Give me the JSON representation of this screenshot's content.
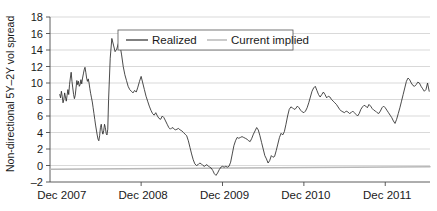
{
  "chart_data": {
    "type": "line",
    "title": "",
    "xlabel": "",
    "ylabel": "Non-directional 5Y–2Y vol spread",
    "ylim": [
      -2,
      18
    ],
    "y_ticks": [
      -2,
      0,
      2,
      4,
      6,
      8,
      10,
      12,
      14,
      16,
      18
    ],
    "y_tick_labels": [
      "–2",
      "0",
      "2",
      "4",
      "6",
      "8",
      "10",
      "12",
      "14",
      "16",
      "18"
    ],
    "x_tick_labels": [
      "Dec 2007",
      "Dec 2008",
      "Dec 2009",
      "Dec 2010",
      "Dec 2011"
    ],
    "x_tick_positions": [
      0,
      1,
      2,
      3,
      4
    ],
    "xlim": [
      -0.12,
      4.55
    ],
    "grid": true,
    "legend_position": "top-center",
    "legend": [
      {
        "name": "Realized",
        "color": "#2b2b2b"
      },
      {
        "name": "Current implied",
        "color": "#bdbdbd"
      }
    ],
    "series": [
      {
        "name": "Realized",
        "color": "#2b2b2b",
        "x": [
          0.0,
          0.01,
          0.02,
          0.03,
          0.04,
          0.05,
          0.06,
          0.07,
          0.08,
          0.09,
          0.1,
          0.11,
          0.12,
          0.13,
          0.14,
          0.15,
          0.16,
          0.17,
          0.18,
          0.19,
          0.2,
          0.21,
          0.22,
          0.23,
          0.24,
          0.25,
          0.26,
          0.27,
          0.28,
          0.29,
          0.3,
          0.31,
          0.32,
          0.33,
          0.34,
          0.35,
          0.36,
          0.37,
          0.38,
          0.39,
          0.4,
          0.41,
          0.42,
          0.43,
          0.44,
          0.45,
          0.46,
          0.47,
          0.48,
          0.49,
          0.5,
          0.51,
          0.52,
          0.53,
          0.54,
          0.55,
          0.56,
          0.57,
          0.58,
          0.59,
          0.6,
          0.62,
          0.64,
          0.66,
          0.68,
          0.7,
          0.72,
          0.74,
          0.76,
          0.78,
          0.8,
          0.82,
          0.84,
          0.86,
          0.88,
          0.9,
          0.92,
          0.94,
          0.96,
          0.98,
          1.0,
          1.02,
          1.04,
          1.06,
          1.08,
          1.1,
          1.12,
          1.14,
          1.16,
          1.18,
          1.2,
          1.22,
          1.24,
          1.26,
          1.28,
          1.3,
          1.32,
          1.34,
          1.36,
          1.38,
          1.4,
          1.42,
          1.44,
          1.46,
          1.48,
          1.5,
          1.52,
          1.54,
          1.56,
          1.58,
          1.6,
          1.62,
          1.64,
          1.66,
          1.68,
          1.7,
          1.72,
          1.74,
          1.76,
          1.78,
          1.8,
          1.82,
          1.84,
          1.86,
          1.88,
          1.9,
          1.92,
          1.94,
          1.96,
          1.98,
          2.0,
          2.02,
          2.04,
          2.06,
          2.08,
          2.1,
          2.12,
          2.14,
          2.16,
          2.18,
          2.2,
          2.22,
          2.24,
          2.26,
          2.28,
          2.3,
          2.32,
          2.34,
          2.36,
          2.38,
          2.4,
          2.42,
          2.44,
          2.46,
          2.48,
          2.5,
          2.52,
          2.54,
          2.56,
          2.58,
          2.6,
          2.62,
          2.64,
          2.66,
          2.68,
          2.7,
          2.72,
          2.74,
          2.76,
          2.78,
          2.8,
          2.82,
          2.84,
          2.86,
          2.88,
          2.9,
          2.92,
          2.94,
          2.96,
          2.98,
          3.0,
          3.02,
          3.04,
          3.06,
          3.08,
          3.1,
          3.12,
          3.14,
          3.16,
          3.18,
          3.2,
          3.22,
          3.24,
          3.26,
          3.28,
          3.3,
          3.32,
          3.34,
          3.36,
          3.38,
          3.4,
          3.42,
          3.44,
          3.46,
          3.48,
          3.5,
          3.52,
          3.54,
          3.56,
          3.58,
          3.6,
          3.62,
          3.64,
          3.66,
          3.68,
          3.7,
          3.72,
          3.74,
          3.76,
          3.78,
          3.8,
          3.82,
          3.84,
          3.86,
          3.88,
          3.9,
          3.92,
          3.94,
          3.96,
          3.98,
          4.0,
          4.02,
          4.04,
          4.06,
          4.08,
          4.1,
          4.12,
          4.14,
          4.16,
          4.18,
          4.2,
          4.22,
          4.24,
          4.26,
          4.28,
          4.3,
          4.32,
          4.34,
          4.36,
          4.38,
          4.4,
          4.42,
          4.44,
          4.46,
          4.48,
          4.5,
          4.52,
          4.54
        ],
        "y": [
          8.6,
          8.2,
          9.0,
          8.4,
          7.6,
          8.0,
          8.8,
          8.3,
          7.8,
          8.5,
          9.2,
          8.6,
          9.8,
          10.6,
          11.3,
          10.2,
          9.4,
          8.6,
          8.1,
          8.5,
          9.4,
          10.3,
          9.8,
          10.2,
          9.6,
          9.8,
          10.4,
          9.9,
          10.6,
          11.1,
          11.6,
          11.9,
          11.3,
          10.6,
          10.2,
          10.5,
          10.0,
          9.3,
          8.7,
          8.2,
          7.7,
          7.0,
          6.3,
          5.6,
          4.9,
          4.3,
          3.7,
          3.2,
          3.0,
          3.6,
          4.6,
          5.0,
          4.2,
          3.8,
          4.2,
          5.0,
          4.6,
          3.9,
          3.7,
          4.4,
          8.0,
          13.0,
          15.4,
          14.6,
          13.8,
          14.1,
          14.8,
          14.6,
          13.4,
          12.0,
          11.0,
          10.3,
          9.6,
          9.2,
          9.0,
          8.8,
          9.1,
          8.9,
          9.5,
          10.2,
          10.8,
          10.0,
          9.2,
          8.4,
          7.8,
          7.2,
          6.7,
          6.3,
          6.1,
          6.4,
          6.0,
          5.7,
          5.6,
          6.0,
          5.8,
          5.4,
          5.0,
          4.6,
          4.4,
          4.6,
          4.5,
          4.3,
          4.4,
          4.5,
          4.3,
          4.2,
          4.0,
          3.8,
          3.6,
          3.0,
          2.2,
          1.4,
          0.7,
          0.2,
          0.0,
          0.1,
          0.3,
          0.2,
          0.0,
          -0.1,
          0.1,
          0.0,
          -0.2,
          -0.3,
          -0.6,
          -1.0,
          -1.2,
          -0.9,
          -0.5,
          -0.2,
          -0.1,
          -0.2,
          -0.1,
          -0.2,
          -0.1,
          0.4,
          1.4,
          2.4,
          3.0,
          3.4,
          3.3,
          3.4,
          3.5,
          3.4,
          3.3,
          3.2,
          3.0,
          2.9,
          3.3,
          3.8,
          4.2,
          4.6,
          4.3,
          3.6,
          2.8,
          2.0,
          1.2,
          0.8,
          0.3,
          0.6,
          1.2,
          1.0,
          1.1,
          1.8,
          2.6,
          3.4,
          3.9,
          3.7,
          4.1,
          5.0,
          6.0,
          6.8,
          7.1,
          7.0,
          6.8,
          6.9,
          7.2,
          7.0,
          6.7,
          6.5,
          6.4,
          6.6,
          7.0,
          7.6,
          8.3,
          9.0,
          9.4,
          9.6,
          9.1,
          8.6,
          8.3,
          8.6,
          8.9,
          8.6,
          8.2,
          8.4,
          8.3,
          8.0,
          7.8,
          7.6,
          7.4,
          7.1,
          6.8,
          6.6,
          6.5,
          6.4,
          6.6,
          6.5,
          6.3,
          6.4,
          6.6,
          6.4,
          6.2,
          6.0,
          6.3,
          6.8,
          7.1,
          7.3,
          7.2,
          7.0,
          7.4,
          7.2,
          6.9,
          6.7,
          6.6,
          6.4,
          6.3,
          6.6,
          7.0,
          7.2,
          7.0,
          6.7,
          6.4,
          6.1,
          5.8,
          5.4,
          5.1,
          5.6,
          6.3,
          7.0,
          7.8,
          8.6,
          9.4,
          10.2,
          10.6,
          10.4,
          10.0,
          9.7,
          9.6,
          9.8,
          10.1,
          10.0,
          9.6,
          9.3,
          9.0,
          9.2,
          10.0,
          9.0
        ],
        "note": "segment A: Dec2007 to mid-2012 part 1"
      },
      {
        "name": "Realized-cont",
        "color": "#2b2b2b",
        "x": [
          3.02,
          3.04,
          3.06,
          3.08,
          3.1,
          3.12,
          3.14,
          3.16,
          3.18,
          3.2,
          3.22,
          3.24,
          3.26,
          3.28,
          3.3,
          3.32,
          3.34,
          3.36,
          3.38,
          3.4
        ],
        "y": [
          9.0,
          9.2,
          9.4,
          9.3,
          9.0,
          8.9,
          9.1,
          9.3,
          9.0,
          8.9,
          9.2,
          9.5,
          9.3,
          9.1,
          8.9,
          9.0,
          9.2,
          9.4,
          9.1,
          9.0
        ],
        "note": "unused placeholder"
      }
    ],
    "implied_line": {
      "name": "Current implied",
      "color": "#bdbdbd",
      "x": [
        -0.12,
        4.55
      ],
      "y": [
        -0.45,
        -0.15
      ],
      "description": "near-flat slightly upward-sloping gray line just below zero"
    },
    "peak_annotations": [
      {
        "label": "max",
        "x_approx": "mid 2008",
        "value": 15.4
      },
      {
        "label": "max2",
        "x_approx": "early 2011",
        "value": 16.1
      },
      {
        "label": "min",
        "x_approx": "late 2008 / early 2009",
        "value": -1.2
      }
    ]
  }
}
